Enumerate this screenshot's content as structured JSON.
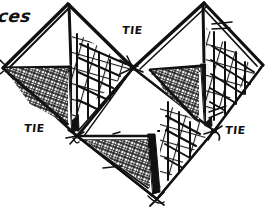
{
  "figure": {
    "medium": "ink line drawing",
    "background_color": "#ffffff",
    "ink_color": "#111111",
    "width": 266,
    "height": 215
  },
  "labels": {
    "partial_word": {
      "text": "ces",
      "x": 0,
      "y": 8,
      "note": "word cropped at left edge of image"
    },
    "tie_top_center": {
      "text": "TIE",
      "x": 123,
      "y": 23
    },
    "tie_bottom_left": {
      "text": "TIE",
      "x": 25,
      "y": 122
    },
    "tie_bottom_right": {
      "text": "TIE",
      "x": 226,
      "y": 124
    }
  },
  "geometry": {
    "left_unit": {
      "apex": [
        68,
        4
      ],
      "left_point": [
        2,
        68
      ],
      "tie_point": [
        77,
        136
      ],
      "center_point": [
        133,
        68
      ],
      "ridge_base": [
        72,
        67
      ]
    },
    "right_unit": {
      "apex": [
        204,
        3
      ],
      "right_point": [
        263,
        65
      ],
      "tie_point": [
        214,
        131
      ],
      "center_point": [
        133,
        68
      ],
      "ridge_base": [
        200,
        66
      ]
    },
    "lower_left_unit": {
      "tie_point": [
        77,
        136
      ],
      "bottom_point": [
        157,
        199
      ],
      "spine_top": [
        150,
        136
      ]
    },
    "lower_right_unit": {
      "tie_point": [
        214,
        131
      ],
      "bottom_point": [
        157,
        199
      ],
      "spine_top": [
        158,
        131
      ]
    }
  },
  "panels": [
    {
      "name": "left-upper-open-panel",
      "fill": "none",
      "texture": "plain"
    },
    {
      "name": "left-mesh-panel",
      "fill": "none",
      "texture": "grid-mesh"
    },
    {
      "name": "left-crosshatch-panel",
      "fill": "none",
      "texture": "dense-crosshatch"
    },
    {
      "name": "left-solid-spine",
      "fill": "solid-black",
      "texture": "solid"
    },
    {
      "name": "right-upper-open-panel",
      "fill": "none",
      "texture": "plain"
    },
    {
      "name": "right-mesh-panel",
      "fill": "none",
      "texture": "grid-mesh"
    },
    {
      "name": "right-crosshatch-panel",
      "fill": "none",
      "texture": "dense-crosshatch"
    },
    {
      "name": "right-solid-spine",
      "fill": "solid-black",
      "texture": "solid"
    },
    {
      "name": "lower-left-crosshatch-panel",
      "fill": "none",
      "texture": "dense-crosshatch"
    },
    {
      "name": "lower-right-mesh-panel",
      "fill": "none",
      "texture": "grid-mesh"
    },
    {
      "name": "lower-solid-spine",
      "fill": "solid-black",
      "texture": "solid"
    }
  ]
}
